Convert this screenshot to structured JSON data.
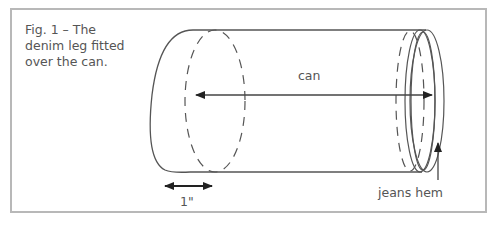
{
  "figure": {
    "caption": "Fig. 1 – The denim leg fitted over the can.",
    "labels": {
      "can": "can",
      "width": "1\"",
      "hem": "jeans hem"
    },
    "colors": {
      "stroke": "#555555",
      "frame": "#b8b8b8",
      "text": "#555555"
    }
  }
}
